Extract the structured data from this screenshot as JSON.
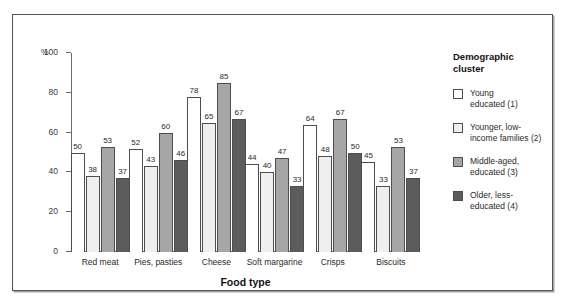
{
  "chart_data": {
    "type": "bar",
    "title": "",
    "xlabel": "Food type",
    "ylabel": "%",
    "ylim": [
      0,
      100
    ],
    "yticks": [
      0,
      20,
      40,
      60,
      80,
      100
    ],
    "y_unit_label": "%",
    "grid": false,
    "legend_position": "right",
    "legend_title": "Demographic cluster",
    "categories": [
      "Red meat",
      "Pies, pasties",
      "Cheese",
      "Soft margarine",
      "Crisps",
      "Biscuits"
    ],
    "series": [
      {
        "name": "Young educated (1)",
        "color": "#ffffff",
        "values": [
          50,
          52,
          78,
          44,
          64,
          45
        ]
      },
      {
        "name": "Younger, low-income families (2)",
        "color": "#efefef",
        "values": [
          38,
          43,
          65,
          40,
          48,
          33
        ]
      },
      {
        "name": "Middle-aged, educated (3)",
        "color": "#a6a6a6",
        "values": [
          53,
          60,
          85,
          47,
          67,
          53
        ]
      },
      {
        "name": "Older, less-educated (4)",
        "color": "#5c5c5c",
        "values": [
          37,
          46,
          67,
          33,
          50,
          37
        ]
      }
    ]
  },
  "legend": {
    "title_line_1": "Demographic",
    "title_line_2": "cluster",
    "items": [
      {
        "label_line_1": "Young",
        "label_line_2": "educated (1)",
        "swatch": "c0"
      },
      {
        "label_line_1": "Younger, low-",
        "label_line_2": "income families (2)",
        "swatch": "c1"
      },
      {
        "label_line_1": "Middle-aged,",
        "label_line_2": "educated (3)",
        "swatch": "c2"
      },
      {
        "label_line_1": "Older, less-",
        "label_line_2": "educated (4)",
        "swatch": "c3"
      }
    ]
  },
  "axis": {
    "x_title": "Food type",
    "y_unit": "%"
  }
}
